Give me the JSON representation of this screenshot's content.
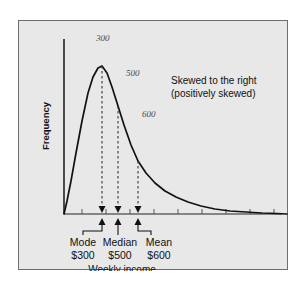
{
  "figure": {
    "background_color": "#e8e8e8",
    "border_color": "#6e6e6e",
    "page_background": "#ffffff"
  },
  "chart_data": {
    "type": "line",
    "title": "",
    "xlabel": "Weekly income",
    "ylabel": "Frequency",
    "note_line1": "Skewed to the right",
    "note_line2": "(positively skewed)",
    "grid": false,
    "legend": "none",
    "axis": {
      "x_range_label": "",
      "y_range_label": "",
      "x_ticks_visible": true,
      "y_ticks_visible": false
    },
    "curve_description": "right-skewed (positively skewed) unimodal frequency distribution with long right tail",
    "markers": [
      {
        "id": "mode",
        "name": "Mode",
        "value": "$300",
        "amount": 300,
        "annotation": "300",
        "x_frac": 0.175
      },
      {
        "id": "median",
        "name": "Median",
        "value": "$500",
        "amount": 500,
        "annotation": "500",
        "x_frac": 0.265
      },
      {
        "id": "mean",
        "name": "Mean",
        "value": "$600",
        "amount": 600,
        "annotation": "600",
        "x_frac": 0.35
      }
    ],
    "curve_points": "45,193 48,180 52,160 57,132 63,100 69,72 74,56 79,47 83,45 88,52 93,66 99,85 105,104 112,124 119,140 127,152 136,162 146,170 157,176 169,181 182,185 196,188 211,190 227,191 243,192 258,192.5 268,193"
  },
  "annotations": {
    "peak_label": "300",
    "mid_label": "500",
    "tail_label": "600"
  },
  "labels": {
    "frequency": "Frequency",
    "weekly_income": "Weekly income",
    "skew_line1": "Skewed to the right",
    "skew_line2": "(positively skewed)",
    "mode_name": "Mode",
    "mode_value": "$300",
    "median_name": "Median",
    "median_value": "$500",
    "mean_name": "Mean",
    "mean_value": "$600"
  }
}
